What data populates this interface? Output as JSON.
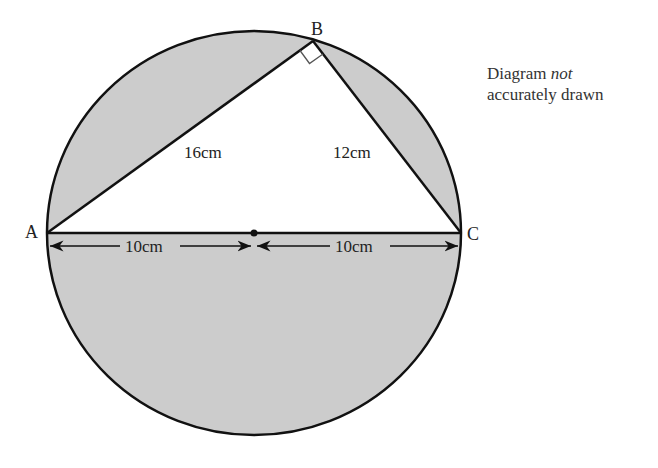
{
  "diagram": {
    "points": {
      "A": {
        "label": "A",
        "x": 47,
        "y": 233
      },
      "B": {
        "label": "B",
        "x": 313,
        "y": 41
      },
      "C": {
        "label": "C",
        "x": 461,
        "y": 233
      },
      "O": {
        "label": "",
        "x": 254,
        "y": 233
      }
    },
    "circle": {
      "cx": 254,
      "cy": 233,
      "rx": 207,
      "ry": 202,
      "fill": "#cccccc",
      "stroke": "#111111"
    },
    "triangle_fill": "#ffffff",
    "labels": {
      "AB": "16cm",
      "BC": "12cm",
      "AO": "10cm",
      "OC": "10cm"
    },
    "right_angle_at": "B",
    "note": {
      "line1_prefix": "Diagram ",
      "line1_italic": "not",
      "line2": "accurately drawn"
    }
  }
}
